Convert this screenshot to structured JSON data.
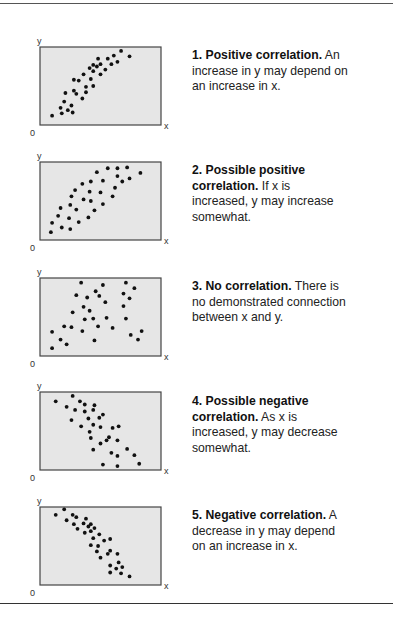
{
  "chart_data": [
    {
      "type": "scatter",
      "title": "1. Positive correlation.",
      "description": "An increase in y may depend on an increase in x.",
      "xlabel": "x",
      "ylabel": "y",
      "origin_label": "0",
      "xlim": [
        0,
        100
      ],
      "ylim": [
        0,
        100
      ],
      "grid": false,
      "legend": "none",
      "points": [
        [
          10,
          12
        ],
        [
          18,
          15
        ],
        [
          17,
          22
        ],
        [
          23,
          19
        ],
        [
          27,
          16
        ],
        [
          26,
          25
        ],
        [
          20,
          30
        ],
        [
          21,
          41
        ],
        [
          35,
          34
        ],
        [
          28,
          44
        ],
        [
          30,
          40
        ],
        [
          38,
          42
        ],
        [
          38,
          49
        ],
        [
          44,
          50
        ],
        [
          28,
          58
        ],
        [
          32,
          57
        ],
        [
          36,
          65
        ],
        [
          42,
          59
        ],
        [
          44,
          69
        ],
        [
          41,
          73
        ],
        [
          44,
          77
        ],
        [
          47,
          75
        ],
        [
          50,
          78
        ],
        [
          48,
          85
        ],
        [
          50,
          65
        ],
        [
          54,
          71
        ],
        [
          56,
          85
        ],
        [
          59,
          78
        ],
        [
          61,
          89
        ],
        [
          64,
          81
        ],
        [
          67,
          95
        ],
        [
          74,
          88
        ]
      ]
    },
    {
      "type": "scatter",
      "title": "2. Possible positive correlation.",
      "description": "If x is increased, y may increase somewhat.",
      "xlabel": "x",
      "ylabel": "y",
      "origin_label": "0",
      "xlim": [
        0,
        100
      ],
      "ylim": [
        0,
        100
      ],
      "grid": false,
      "legend": "none",
      "points": [
        [
          9,
          10
        ],
        [
          18,
          16
        ],
        [
          25,
          14
        ],
        [
          10,
          22
        ],
        [
          24,
          28
        ],
        [
          32,
          23
        ],
        [
          40,
          29
        ],
        [
          15,
          31
        ],
        [
          17,
          41
        ],
        [
          30,
          39
        ],
        [
          25,
          45
        ],
        [
          26,
          56
        ],
        [
          36,
          52
        ],
        [
          42,
          50
        ],
        [
          45,
          38
        ],
        [
          52,
          46
        ],
        [
          29,
          64
        ],
        [
          35,
          72
        ],
        [
          41,
          62
        ],
        [
          50,
          61
        ],
        [
          60,
          56
        ],
        [
          42,
          75
        ],
        [
          52,
          76
        ],
        [
          62,
          67
        ],
        [
          68,
          75
        ],
        [
          74,
          79
        ],
        [
          47,
          87
        ],
        [
          56,
          92
        ],
        [
          64,
          92
        ],
        [
          72,
          93
        ],
        [
          64,
          82
        ],
        [
          83,
          86
        ]
      ]
    },
    {
      "type": "scatter",
      "title": "3. No correlation.",
      "description": "There is no demonstrated connection between x and y.",
      "xlabel": "x",
      "ylabel": "y",
      "origin_label": "0",
      "xlim": [
        0,
        100
      ],
      "ylim": [
        0,
        100
      ],
      "grid": false,
      "legend": "none",
      "points": [
        [
          10,
          10
        ],
        [
          22,
          15
        ],
        [
          17,
          21
        ],
        [
          10,
          31
        ],
        [
          20,
          38
        ],
        [
          26,
          37
        ],
        [
          35,
          32
        ],
        [
          45,
          20
        ],
        [
          48,
          38
        ],
        [
          60,
          36
        ],
        [
          55,
          49
        ],
        [
          44,
          48
        ],
        [
          37,
          47
        ],
        [
          27,
          56
        ],
        [
          41,
          58
        ],
        [
          36,
          63
        ],
        [
          30,
          78
        ],
        [
          39,
          75
        ],
        [
          46,
          83
        ],
        [
          49,
          77
        ],
        [
          54,
          69
        ],
        [
          34,
          94
        ],
        [
          52,
          91
        ],
        [
          69,
          64
        ],
        [
          71,
          48
        ],
        [
          69,
          80
        ],
        [
          74,
          74
        ],
        [
          71,
          94
        ],
        [
          78,
          87
        ],
        [
          75,
          27
        ],
        [
          81,
          21
        ],
        [
          84,
          32
        ]
      ]
    },
    {
      "type": "scatter",
      "title": "4. Possible negative correlation.",
      "description": "As x is increased, y may decrease somewhat.",
      "xlabel": "x",
      "ylabel": "y",
      "origin_label": "0",
      "xlim": [
        0,
        100
      ],
      "ylim": [
        0,
        100
      ],
      "grid": false,
      "legend": "none",
      "points": [
        [
          13,
          88
        ],
        [
          27,
          95
        ],
        [
          22,
          81
        ],
        [
          29,
          77
        ],
        [
          33,
          88
        ],
        [
          37,
          84
        ],
        [
          37,
          75
        ],
        [
          45,
          83
        ],
        [
          44,
          77
        ],
        [
          26,
          64
        ],
        [
          40,
          66
        ],
        [
          34,
          56
        ],
        [
          44,
          58
        ],
        [
          49,
          67
        ],
        [
          52,
          71
        ],
        [
          50,
          55
        ],
        [
          41,
          49
        ],
        [
          42,
          41
        ],
        [
          60,
          54
        ],
        [
          65,
          56
        ],
        [
          57,
          42
        ],
        [
          55,
          38
        ],
        [
          50,
          34
        ],
        [
          64,
          38
        ],
        [
          44,
          26
        ],
        [
          59,
          22
        ],
        [
          64,
          18
        ],
        [
          72,
          27
        ],
        [
          78,
          19
        ],
        [
          82,
          8
        ],
        [
          52,
          7
        ],
        [
          64,
          5
        ]
      ]
    },
    {
      "type": "scatter",
      "title": "5. Negative correlation.",
      "description": "A decrease in y may depend on an increase in x.",
      "xlabel": "x",
      "ylabel": "y",
      "origin_label": "0",
      "xlim": [
        0,
        100
      ],
      "ylim": [
        0,
        100
      ],
      "grid": false,
      "legend": "none",
      "points": [
        [
          13,
          90
        ],
        [
          20,
          97
        ],
        [
          22,
          83
        ],
        [
          27,
          90
        ],
        [
          30,
          87
        ],
        [
          28,
          78
        ],
        [
          31,
          72
        ],
        [
          36,
          79
        ],
        [
          38,
          85
        ],
        [
          40,
          75
        ],
        [
          42,
          78
        ],
        [
          45,
          73
        ],
        [
          42,
          69
        ],
        [
          37,
          67
        ],
        [
          49,
          65
        ],
        [
          44,
          60
        ],
        [
          53,
          57
        ],
        [
          58,
          59
        ],
        [
          42,
          51
        ],
        [
          48,
          50
        ],
        [
          47,
          43
        ],
        [
          50,
          35
        ],
        [
          56,
          40
        ],
        [
          58,
          44
        ],
        [
          64,
          40
        ],
        [
          65,
          29
        ],
        [
          58,
          25
        ],
        [
          63,
          21
        ],
        [
          68,
          23
        ],
        [
          58,
          16
        ],
        [
          67,
          15
        ],
        [
          74,
          11
        ]
      ]
    }
  ],
  "panels": [
    {
      "title": "1. Positive correlation.",
      "body_lines": [
        "An",
        "increase in y may depend on",
        "an increase in x."
      ]
    },
    {
      "title_lines": [
        "2. Possible positive",
        "correlation."
      ],
      "body_lines": [
        "If x is",
        "increased, y may increase",
        "somewhat."
      ]
    },
    {
      "title": "3. No correlation.",
      "body_lines": [
        "There is",
        "no demonstrated connection",
        "between x and y."
      ]
    },
    {
      "title_lines": [
        "4. Possible negative",
        "correlation."
      ],
      "body_lines": [
        "As x is",
        "increased, y may decrease",
        "somewhat."
      ]
    },
    {
      "title": "5. Negative correlation.",
      "body_lines": [
        "A",
        "decrease in y may depend",
        "on an increase in x."
      ]
    }
  ],
  "colors": {
    "plot_fill": "#e6e6e6",
    "plot_border": "#444444",
    "dot": "#111111",
    "text": "#222222"
  }
}
